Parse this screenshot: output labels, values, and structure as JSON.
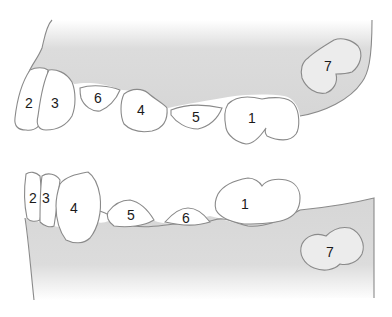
{
  "diagram": {
    "type": "dental-diagram",
    "colors": {
      "background": "#ffffff",
      "gum_fill": "#d9d9d9",
      "outline": "#8a8a8a",
      "tooth_fill": "#ffffff",
      "unerupted_fill": "#ececec",
      "label_text": "#1a1a1a"
    },
    "upper_jaw": {
      "teeth": [
        {
          "id": "u2",
          "label": "2"
        },
        {
          "id": "u3",
          "label": "3"
        },
        {
          "id": "u6",
          "label": "6"
        },
        {
          "id": "u4",
          "label": "4"
        },
        {
          "id": "u5",
          "label": "5"
        },
        {
          "id": "u1",
          "label": "1"
        },
        {
          "id": "u7",
          "label": "7"
        }
      ]
    },
    "lower_jaw": {
      "teeth": [
        {
          "id": "l2",
          "label": "2"
        },
        {
          "id": "l3",
          "label": "3"
        },
        {
          "id": "l4",
          "label": "4"
        },
        {
          "id": "l5",
          "label": "5"
        },
        {
          "id": "l6",
          "label": "6"
        },
        {
          "id": "l1",
          "label": "1"
        },
        {
          "id": "l7",
          "label": "7"
        }
      ]
    }
  }
}
